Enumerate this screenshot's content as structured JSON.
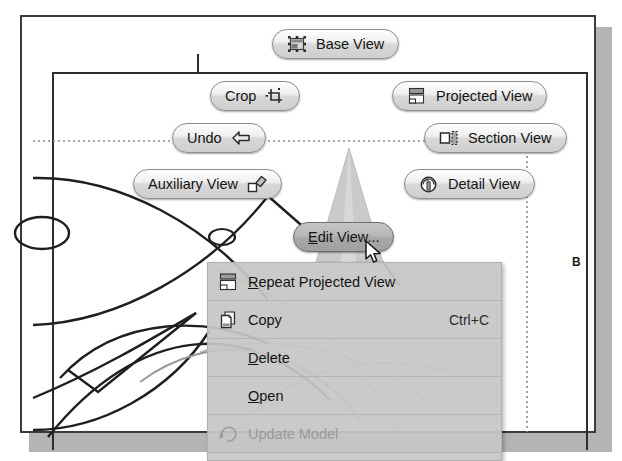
{
  "sheet": {
    "zone_label": "B"
  },
  "marking_menu": {
    "buttons": [
      {
        "id": "base-view",
        "label": "Base View",
        "icon": "base-view-icon",
        "icon_side": "before",
        "selected": false,
        "x": 272,
        "y": 29
      },
      {
        "id": "crop",
        "label": "Crop",
        "icon": "crop-icon",
        "icon_side": "after",
        "selected": false,
        "x": 210,
        "y": 81
      },
      {
        "id": "projected-view",
        "label": "Projected View",
        "icon": "projected-view-icon",
        "icon_side": "before",
        "selected": false,
        "x": 392,
        "y": 81
      },
      {
        "id": "undo",
        "label": "Undo",
        "icon": "undo-icon",
        "icon_side": "after",
        "selected": false,
        "x": 172,
        "y": 123
      },
      {
        "id": "section-view",
        "label": "Section View",
        "icon": "section-view-icon",
        "icon_side": "before",
        "selected": false,
        "x": 424,
        "y": 123
      },
      {
        "id": "auxiliary-view",
        "label": "Auxiliary View",
        "icon": "auxiliary-view-icon",
        "icon_side": "after",
        "selected": false,
        "x": 133,
        "y": 169
      },
      {
        "id": "detail-view",
        "label": "Detail View",
        "icon": "detail-view-icon",
        "icon_side": "before",
        "selected": false,
        "x": 404,
        "y": 169
      },
      {
        "id": "edit-view",
        "label": "Edit View...",
        "icon": "",
        "icon_side": "none",
        "selected": true,
        "x": 293,
        "y": 222
      }
    ]
  },
  "context_menu": {
    "items": [
      {
        "id": "repeat-projected-view",
        "label": "Repeat Projected View",
        "mnemonic": "R",
        "accel": "",
        "icon": "projected-view-icon",
        "disabled": false
      },
      {
        "id": "copy",
        "label": "Copy",
        "mnemonic": "",
        "accel": "Ctrl+C",
        "icon": "copy-icon",
        "disabled": false
      },
      {
        "id": "delete",
        "label": "Delete",
        "mnemonic": "D",
        "accel": "",
        "icon": "",
        "disabled": false
      },
      {
        "id": "open",
        "label": "Open",
        "mnemonic": "O",
        "accel": "",
        "icon": "",
        "disabled": false
      },
      {
        "id": "update-model",
        "label": "Update Model",
        "mnemonic": "",
        "accel": "",
        "icon": "update-model-icon",
        "disabled": true
      }
    ]
  },
  "colors": {
    "sheet_border": "#3a3a3a",
    "button_face": "#e8e8e8",
    "button_selected": "#aeaeae",
    "menu_face": "#c6c6c6",
    "geometry_stroke": "#1f1f1f",
    "cone_fill": "#c9c9c9"
  }
}
